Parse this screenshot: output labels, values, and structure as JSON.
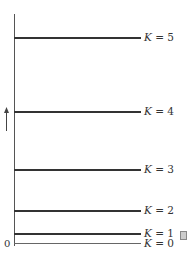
{
  "diagram": {
    "type": "energy-level-diagram",
    "axis": {
      "origin_label": "0",
      "arrow_direction": "up"
    },
    "levels": [
      {
        "label": "K = 5",
        "var": "K",
        "value": "5",
        "y": 37
      },
      {
        "label": "K = 4",
        "var": "K",
        "value": "4",
        "y": 111
      },
      {
        "label": "K = 3",
        "var": "K",
        "value": "3",
        "y": 169
      },
      {
        "label": "K = 2",
        "var": "K",
        "value": "2",
        "y": 210
      },
      {
        "label": "K = 1",
        "var": "K",
        "value": "1",
        "y": 233
      },
      {
        "label": "K = 0",
        "var": "K",
        "value": "0",
        "y": 243
      }
    ],
    "colors": {
      "line": "#333333",
      "axis": "#555555",
      "text": "#333333"
    }
  }
}
